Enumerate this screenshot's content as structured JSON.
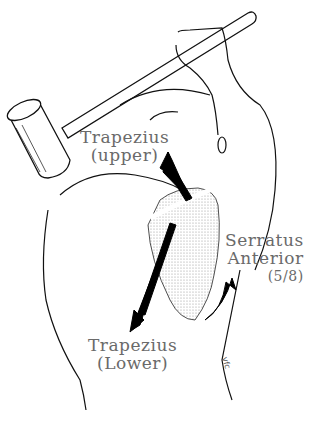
{
  "figure": {
    "labels": {
      "trapezius_upper": {
        "line1": "Trapezius",
        "line2": "(upper)"
      },
      "serratus_anterior": {
        "line1": "Serratus",
        "line2": "Anterior",
        "line3": "(5/8)"
      },
      "trapezius_lower": {
        "line1": "Trapezius",
        "line2": "(Lower)"
      }
    },
    "signature": "vfc",
    "colors": {
      "line": "#111111",
      "label": "#6a6a6a",
      "background": "#ffffff",
      "shading": "#bdbdbd"
    }
  }
}
